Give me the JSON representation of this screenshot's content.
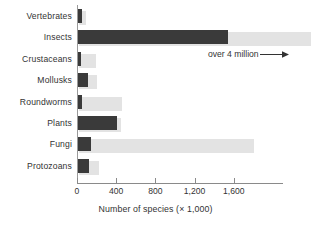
{
  "chart_data": {
    "type": "bar",
    "orientation": "horizontal",
    "title": "",
    "xlabel": "Number of species (× 1,000)",
    "ylabel": "",
    "categories": [
      "Vertebrates",
      "Insects",
      "Crustaceans",
      "Mollusks",
      "Roundworms",
      "Plants",
      "Fungi",
      "Protozoans"
    ],
    "values": [
      50,
      1540,
      45,
      110,
      50,
      410,
      145,
      120
    ],
    "shadow_values": [
      75,
      4000,
      175,
      180,
      440,
      430,
      1790,
      205
    ],
    "xlim": [
      0,
      2100
    ],
    "ylim": null,
    "xticks": [
      0,
      400,
      800,
      1200,
      1600
    ],
    "xticklabels": [
      "0",
      "400",
      "800",
      "1,200",
      "1,600"
    ],
    "grid": false,
    "legend": null,
    "annotations": [
      {
        "text": "over 4 million",
        "arrow": "right-arrow-icon",
        "target_category": "Insects"
      }
    ],
    "colors": {
      "bar": "#3a3a3a",
      "bar_shadow": "#e3e3e3",
      "axis": "#8a8a8a",
      "text": "#333333",
      "background": "#ffffff"
    }
  }
}
